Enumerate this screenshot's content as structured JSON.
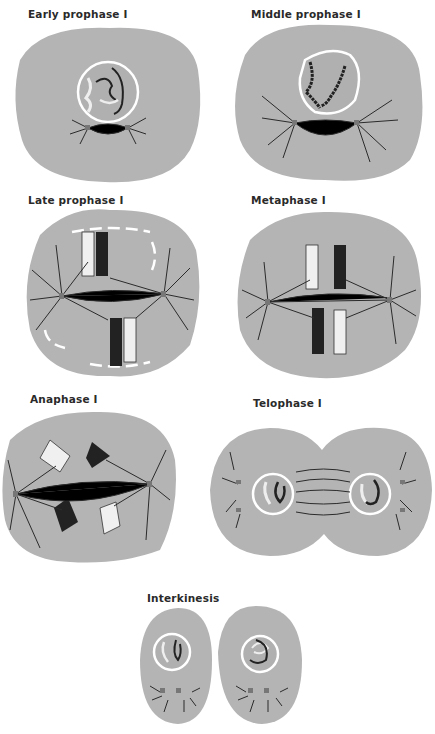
{
  "figure": {
    "colors": {
      "cell": "#b4b4b4",
      "nucleus_membrane": "#ffffff",
      "chromosome_dark": "#1e1e1e",
      "chromosome_light": "#f2f2f2",
      "spindle": "#2b2b2b"
    },
    "panels": [
      {
        "id": "early-prophase",
        "label": "Early prophase I"
      },
      {
        "id": "middle-prophase",
        "label": "Middle prophase I"
      },
      {
        "id": "late-prophase",
        "label": "Late prophase I"
      },
      {
        "id": "metaphase",
        "label": "Metaphase I"
      },
      {
        "id": "anaphase",
        "label": "Anaphase I"
      },
      {
        "id": "telophase",
        "label": "Telophase I"
      },
      {
        "id": "interkinesis",
        "label": "Interkinesis"
      }
    ]
  }
}
